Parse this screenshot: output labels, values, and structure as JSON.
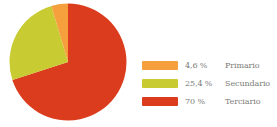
{
  "chart_data": {
    "type": "pie",
    "title": "",
    "legend_position": "right",
    "grid": false,
    "categories": [
      "Primario",
      "Secundario",
      "Terciario"
    ],
    "values": [
      4.6,
      25.4,
      70
    ],
    "value_labels": [
      "4,6 %",
      "25,4 %",
      "70 %"
    ],
    "colors": [
      "#F5A03C",
      "#C8CC32",
      "#DC3C1E"
    ],
    "units": "percent",
    "start_angle_deg": 0,
    "direction": "clockwise",
    "slices": [
      {
        "label": "Primario",
        "value": 4.6,
        "value_label": "4,6 %",
        "color": "#F5A03C"
      },
      {
        "label": "Secundario",
        "value": 25.4,
        "value_label": "25,4 %",
        "color": "#C8CC32"
      },
      {
        "label": "Terciario",
        "value": 70,
        "value_label": "70 %",
        "color": "#DC3C1E"
      }
    ]
  },
  "legend": {
    "rows": [
      {
        "value_label": "4,6 %",
        "label": "Primario",
        "color": "#F5A03C"
      },
      {
        "value_label": "25,4 %",
        "label": "Secundario",
        "color": "#C8CC32"
      },
      {
        "value_label": "70 %",
        "label": "Terciario",
        "color": "#DC3C1E"
      }
    ]
  },
  "palette": {
    "background": "#FFFFFF",
    "text": "#7C7C78",
    "primario": "#F5A03C",
    "secundario": "#C8CC32",
    "terciario": "#DC3C1E"
  }
}
